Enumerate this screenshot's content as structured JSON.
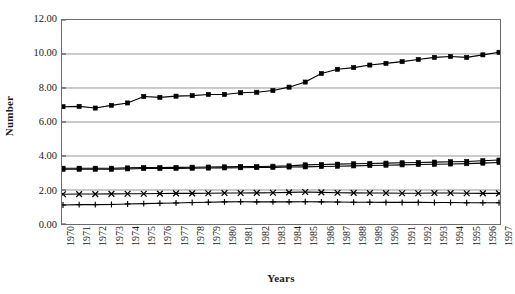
{
  "chart_data": {
    "type": "line",
    "title": "",
    "xlabel": "Years",
    "ylabel": "Number",
    "grid": true,
    "legend": "none",
    "ylim": [
      0,
      12
    ],
    "yticks": [
      "0.00",
      "2.00",
      "4.00",
      "6.00",
      "8.00",
      "10.00",
      "12.00"
    ],
    "ytick_values": [
      0,
      2,
      4,
      6,
      8,
      10,
      12
    ],
    "x": [
      1970,
      1971,
      1972,
      1973,
      1974,
      1975,
      1976,
      1977,
      1978,
      1979,
      1980,
      1981,
      1982,
      1983,
      1984,
      1985,
      1986,
      1987,
      1988,
      1989,
      1990,
      1991,
      1992,
      1993,
      1994,
      1995,
      1996,
      1997
    ],
    "categories": [
      "1970",
      "1971",
      "1972",
      "1973",
      "1974",
      "1975",
      "1976",
      "1977",
      "1978",
      "1979",
      "1980",
      "1981",
      "1982",
      "1983",
      "1984",
      "1985",
      "1986",
      "1987",
      "1988",
      "1989",
      "1990",
      "1991",
      "1992",
      "1993",
      "1994",
      "1995",
      "1996",
      "1997"
    ],
    "series": [
      {
        "name": "Series 1",
        "marker": "square",
        "color": "#000000",
        "values": [
          6.9,
          6.92,
          6.82,
          6.98,
          7.12,
          7.5,
          7.45,
          7.52,
          7.55,
          7.62,
          7.62,
          7.72,
          7.75,
          7.85,
          8.05,
          8.35,
          8.85,
          9.1,
          9.2,
          9.35,
          9.45,
          9.55,
          9.68,
          9.8,
          9.85,
          9.8,
          9.95,
          10.1
        ]
      },
      {
        "name": "Series 2",
        "marker": "square",
        "color": "#000000",
        "values": [
          3.28,
          3.28,
          3.28,
          3.28,
          3.3,
          3.32,
          3.32,
          3.33,
          3.34,
          3.35,
          3.36,
          3.38,
          3.38,
          3.4,
          3.42,
          3.48,
          3.5,
          3.52,
          3.54,
          3.56,
          3.58,
          3.6,
          3.62,
          3.64,
          3.66,
          3.68,
          3.72,
          3.76
        ]
      },
      {
        "name": "Series 3",
        "marker": "square",
        "color": "#000000",
        "values": [
          3.22,
          3.22,
          3.22,
          3.22,
          3.24,
          3.26,
          3.26,
          3.27,
          3.28,
          3.29,
          3.3,
          3.31,
          3.32,
          3.33,
          3.35,
          3.36,
          3.38,
          3.4,
          3.42,
          3.44,
          3.46,
          3.48,
          3.5,
          3.51,
          3.53,
          3.55,
          3.58,
          3.62
        ]
      },
      {
        "name": "Series 4",
        "marker": "cross",
        "color": "#000000",
        "values": [
          1.75,
          1.76,
          1.76,
          1.77,
          1.78,
          1.78,
          1.79,
          1.8,
          1.8,
          1.81,
          1.82,
          1.82,
          1.83,
          1.84,
          1.86,
          1.88,
          1.86,
          1.84,
          1.83,
          1.82,
          1.82,
          1.81,
          1.81,
          1.82,
          1.82,
          1.81,
          1.8,
          1.8
        ]
      },
      {
        "name": "Series 5",
        "marker": "plus",
        "color": "#000000",
        "values": [
          1.12,
          1.14,
          1.14,
          1.15,
          1.18,
          1.2,
          1.22,
          1.24,
          1.26,
          1.28,
          1.3,
          1.31,
          1.3,
          1.3,
          1.3,
          1.31,
          1.3,
          1.29,
          1.28,
          1.28,
          1.27,
          1.27,
          1.27,
          1.26,
          1.26,
          1.25,
          1.25,
          1.25
        ]
      }
    ]
  },
  "axes": {
    "y_title": "Number",
    "x_title": "Years"
  }
}
